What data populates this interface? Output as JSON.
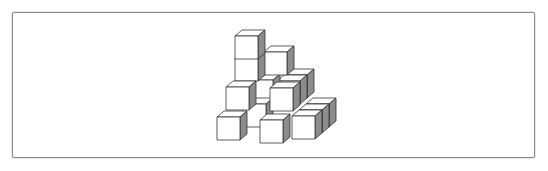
{
  "figure": {
    "colors": {
      "front_face": "#ffffff",
      "top_face": "#ffffff",
      "side_face": "#8c8c8c",
      "edge": "#333333",
      "frame_border": "#8a8a8a"
    },
    "cube_size": 23,
    "depth_offset": [
      7,
      -6
    ],
    "cubes": [
      {
        "x": 306,
        "y": 104
      },
      {
        "x": 299,
        "y": 110
      },
      {
        "x": 284,
        "y": 75
      },
      {
        "x": 277,
        "y": 81
      },
      {
        "x": 250,
        "y": 80
      },
      {
        "x": 264,
        "y": 52
      },
      {
        "x": 235,
        "y": 58
      },
      {
        "x": 235,
        "y": 36
      },
      {
        "x": 243,
        "y": 104
      },
      {
        "x": 226,
        "y": 87
      },
      {
        "x": 270,
        "y": 88
      },
      {
        "x": 217,
        "y": 117
      },
      {
        "x": 292,
        "y": 116
      },
      {
        "x": 260,
        "y": 120
      }
    ]
  }
}
